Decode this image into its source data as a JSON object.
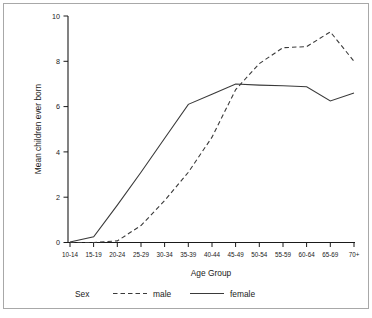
{
  "figure": {
    "background_color": "#ffffff",
    "frame_color": "#a8a8a8",
    "line_color": "#3a3a3a"
  },
  "chart_data": {
    "type": "line",
    "title": "",
    "xlabel": "Age Group",
    "ylabel": "Mean children ever born",
    "categories": [
      "10-14",
      "15-19",
      "20-24",
      "25-29",
      "30-34",
      "35-39",
      "40-44",
      "45-49",
      "50-54",
      "55-59",
      "60-64",
      "65-69",
      "70+"
    ],
    "series": [
      {
        "name": "male",
        "style": "dashed",
        "values": [
          0.0,
          0.0,
          0.07,
          0.75,
          1.85,
          3.1,
          4.65,
          6.75,
          7.9,
          8.6,
          8.65,
          9.3,
          8.0
        ]
      },
      {
        "name": "female",
        "style": "solid",
        "values": [
          0.02,
          0.25,
          1.65,
          3.1,
          4.6,
          6.1,
          6.55,
          7.0,
          6.95,
          6.92,
          6.88,
          6.25,
          6.6
        ]
      }
    ],
    "ylim": [
      0,
      10
    ],
    "yticks": [
      0,
      2,
      4,
      6,
      8,
      10
    ],
    "ytick_labels": [
      "0",
      "2",
      "4",
      "6",
      "8",
      "10"
    ],
    "grid": false,
    "legend": {
      "title": "Sex",
      "position": "bottom",
      "entries": [
        {
          "label": "male",
          "style": "dashed"
        },
        {
          "label": "female",
          "style": "solid"
        }
      ]
    }
  }
}
